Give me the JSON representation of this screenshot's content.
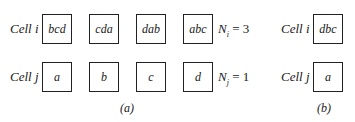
{
  "panel_a": {
    "caption": "(a)",
    "row_i": {
      "label": "Cell i",
      "boxes": [
        "bcd",
        "cda",
        "dab",
        "abc"
      ],
      "count_var": "N",
      "count_sub": "i",
      "count_eq": " = 3"
    },
    "row_j": {
      "label": "Cell j",
      "boxes": [
        "a",
        "b",
        "c",
        "d"
      ],
      "count_var": "N",
      "count_sub": "j",
      "count_eq": " = 1"
    }
  },
  "panel_b": {
    "caption": "(b)",
    "row_i": {
      "label": "Cell i",
      "boxes": [
        "dbc"
      ]
    },
    "row_j": {
      "label": "Cell j",
      "boxes": [
        "a"
      ]
    }
  }
}
